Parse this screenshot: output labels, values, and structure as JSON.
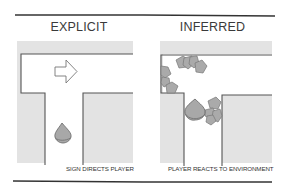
{
  "panels": [
    {
      "title": "EXPLICIT",
      "caption": "SIGN DIRECTS PLAYER",
      "elements": [
        "arrow-sign",
        "player-marker"
      ]
    },
    {
      "title": "INFERRED",
      "caption": "PLAYER REACTS TO ENVIRONMENT",
      "elements": [
        "rubble-debris",
        "player-marker"
      ]
    }
  ],
  "colors": {
    "wall_fill": "#e3e3e3",
    "wall_stroke": "#555555",
    "rubble_fill": "#aaaaaa",
    "player_fill": "#a8a8a8",
    "rule_line": "#333333"
  }
}
